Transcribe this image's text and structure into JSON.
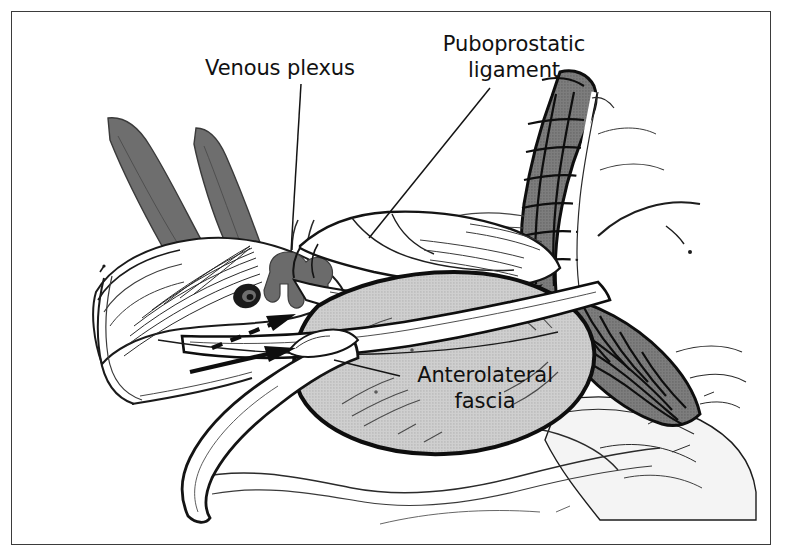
{
  "figure": {
    "type": "anatomical-illustration",
    "background_color": "#ffffff",
    "frame_color": "#3b3b3b",
    "ink_color": "#111111"
  },
  "labels": {
    "venous_plexus": "Venous plexus",
    "puboprostatic_line1": "Puboprostatic",
    "puboprostatic_line2": "ligament",
    "anterolateral_line1": "Anterolateral",
    "anterolateral_line2": "fascia"
  },
  "structures": {
    "prostate_fill": "#c9c9c9",
    "muscle_fascicle_fill": "#757575",
    "retractor_fill": "#6e6e6e",
    "venous_plexus_fill": "#6b6b6b",
    "vessel_lumen_fill": "#1a1a1a",
    "fascia_fill": "#ffffff",
    "soft_tissue_fill": "#f2f2f2"
  },
  "annotations": {
    "arrow_solid": "solid-arrow-pointing-upper-right",
    "arrow_dashed": "dashed-arrow-pointing-upper-right"
  }
}
